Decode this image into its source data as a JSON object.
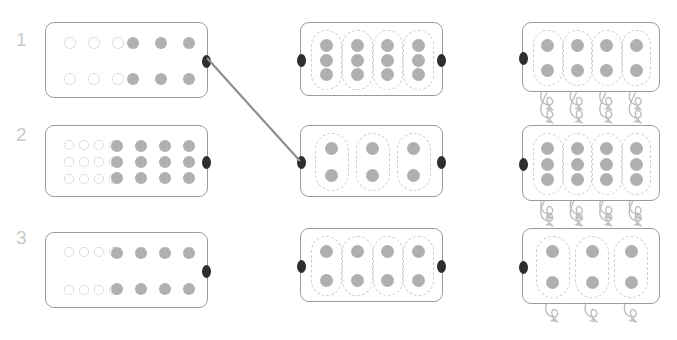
{
  "canvas": {
    "width": 677,
    "height": 340,
    "background": "#ffffff"
  },
  "palette": {
    "panel_border": "#9b9b9b",
    "filled_dot": "#b0b0b0",
    "hollow_dot_border": "#b9b9b9",
    "capsule_border": "#cfcfcf",
    "port": "#2e2e2e",
    "connector_line": "#8e8e8e",
    "arrow": "#bdbdbd",
    "row_label": "#c9c9c9"
  },
  "rows": [
    {
      "label": "1",
      "label_pos": {
        "x": 16,
        "y": 30
      },
      "panels": [
        {
          "name": "panel-r1-left",
          "kind": "mapping",
          "rect": {
            "x": 45,
            "y": 22,
            "w": 163,
            "h": 76
          },
          "hollow_rows": 2,
          "hollow_cols": 3,
          "filled_rows": 2,
          "filled_cols": 3,
          "arrows": 2,
          "ports": [
            "right"
          ]
        },
        {
          "name": "panel-r1-middle",
          "kind": "capsules",
          "rect": {
            "x": 300,
            "y": 22,
            "w": 143,
            "h": 74
          },
          "capsules": 4,
          "dots_per_capsule": 3,
          "ports": [
            "left",
            "right"
          ],
          "loops_top": 0,
          "loops_bottom": 0
        },
        {
          "name": "panel-r1-right",
          "kind": "capsules",
          "rect": {
            "x": 522,
            "y": 22,
            "w": 138,
            "h": 70
          },
          "capsules": 4,
          "dots_per_capsule": 2,
          "ports": [
            "left"
          ],
          "loops_top": 0,
          "loops_bottom": 4
        }
      ]
    },
    {
      "label": "2",
      "label_pos": {
        "x": 16,
        "y": 125
      },
      "panels": [
        {
          "name": "panel-r2-left",
          "kind": "mapping",
          "rect": {
            "x": 45,
            "y": 125,
            "w": 163,
            "h": 72
          },
          "hollow_rows": 3,
          "hollow_cols": 4,
          "filled_rows": 3,
          "filled_cols": 4,
          "arrows": 3,
          "ports": [
            "right"
          ]
        },
        {
          "name": "panel-r2-middle",
          "kind": "capsules",
          "rect": {
            "x": 300,
            "y": 125,
            "w": 143,
            "h": 72
          },
          "capsules": 3,
          "dots_per_capsule": 2,
          "ports": [
            "left",
            "right"
          ],
          "loops_top": 0,
          "loops_bottom": 0
        },
        {
          "name": "panel-r2-right",
          "kind": "capsules",
          "rect": {
            "x": 522,
            "y": 125,
            "w": 138,
            "h": 76
          },
          "capsules": 4,
          "dots_per_capsule": 3,
          "ports": [
            "left"
          ],
          "loops_top": 4,
          "loops_bottom": 4
        }
      ]
    },
    {
      "label": "3",
      "label_pos": {
        "x": 16,
        "y": 228
      },
      "panels": [
        {
          "name": "panel-r3-left",
          "kind": "mapping",
          "rect": {
            "x": 45,
            "y": 232,
            "w": 163,
            "h": 76
          },
          "hollow_rows": 2,
          "hollow_cols": 4,
          "filled_rows": 2,
          "filled_cols": 4,
          "arrows": 2,
          "ports": [
            "right"
          ]
        },
        {
          "name": "panel-r3-middle",
          "kind": "capsules",
          "rect": {
            "x": 300,
            "y": 228,
            "w": 143,
            "h": 74
          },
          "capsules": 4,
          "dots_per_capsule": 2,
          "ports": [
            "left",
            "right"
          ],
          "loops_top": 0,
          "loops_bottom": 0
        },
        {
          "name": "panel-r3-right",
          "kind": "capsules",
          "rect": {
            "x": 522,
            "y": 228,
            "w": 138,
            "h": 76
          },
          "capsules": 3,
          "dots_per_capsule": 2,
          "ports": [
            "left"
          ],
          "loops_top": 4,
          "loops_bottom": 3
        }
      ]
    }
  ],
  "connectors": [
    {
      "name": "connector-r1left-to-r2middle",
      "from": {
        "x": 207,
        "y": 58
      },
      "to": {
        "x": 300,
        "y": 161
      }
    }
  ]
}
